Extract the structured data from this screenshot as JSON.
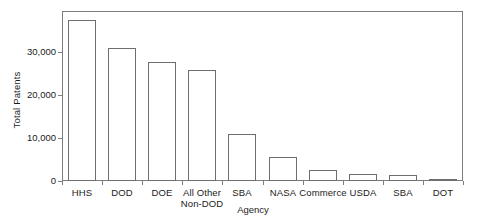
{
  "chart_data": {
    "type": "bar",
    "title": "",
    "subtitle": "",
    "xlabel": "Agency",
    "ylabel": "Total Patents",
    "categories": [
      "HHS",
      "DOD",
      "DOE",
      "All Other\nNon-DOD",
      "SBA",
      "NASA",
      "Commerce",
      "USDA",
      "SBA",
      "DOT"
    ],
    "values": [
      37500,
      31000,
      27600,
      25800,
      10900,
      5600,
      2500,
      1700,
      1500,
      500
    ],
    "series": [
      {
        "name": "Total Patents",
        "values": [
          37500,
          31000,
          27600,
          25800,
          10900,
          5600,
          2500,
          1700,
          1500,
          500
        ]
      }
    ],
    "ylim": [
      0,
      39500
    ],
    "xlim": [
      0,
      10
    ],
    "ytick_values": [
      0,
      10000,
      20000,
      30000
    ],
    "ytick_labels": [
      "0",
      "10,000",
      "20,000",
      "30,000"
    ],
    "grid": false,
    "legend": false,
    "legend_position": "none",
    "bar_fill_color": "#ffffff",
    "bar_edge_color": "#6e6e6e",
    "axis_color": "#7d7d7d",
    "background_color": "#ffffff",
    "annotations": []
  },
  "figure": {
    "plot_area": {
      "left_px": 62,
      "top_px": 11,
      "width_px": 401,
      "height_px": 170,
      "baseline_y_px": 181
    }
  }
}
